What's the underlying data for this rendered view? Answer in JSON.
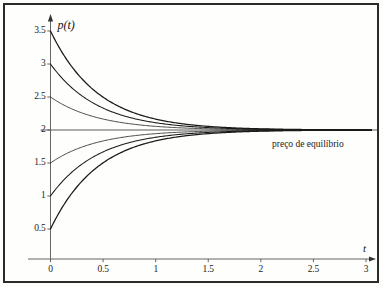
{
  "figure": {
    "background_color": "#fdfdfb",
    "frame_color": "#2a2a2a",
    "curve_color": "#1a1a1a",
    "axis_color": "#555555"
  },
  "axes": {
    "y_title": "p(t)",
    "x_title": "t",
    "x_ticks": [
      "0",
      "0.5",
      "1",
      "1.5",
      "2",
      "2.5",
      "3"
    ],
    "x_tick_values": [
      0,
      0.5,
      1,
      1.5,
      2,
      2.5,
      3
    ],
    "y_ticks": [
      "0.5",
      "1",
      "1.5",
      "2",
      "2.5",
      "3",
      "3.5"
    ],
    "y_tick_values": [
      0.5,
      1,
      1.5,
      2,
      2.5,
      3,
      3.5
    ]
  },
  "annotations": {
    "equilibrium": "preço de equilíbrio",
    "equilibrium_value": 2
  },
  "chart_data": {
    "type": "line",
    "title": "",
    "xlabel": "t",
    "ylabel": "p(t)",
    "xlim": [
      0,
      3.1
    ],
    "ylim": [
      0.3,
      3.72
    ],
    "grid": false,
    "legend": false,
    "equilibrium_line": {
      "y": 2,
      "label": "preço de equilíbrio"
    },
    "x": [
      0,
      0.1,
      0.2,
      0.3,
      0.4,
      0.5,
      0.6,
      0.7,
      0.8,
      0.9,
      1.0,
      1.2,
      1.4,
      1.6,
      1.8,
      2.0,
      2.2,
      2.4,
      2.6,
      2.8,
      3.0
    ],
    "series": [
      {
        "name": "p0 = 3.5",
        "initial_value": 3.5,
        "values": [
          3.5,
          3.142,
          2.874,
          2.674,
          2.524,
          2.412,
          2.328,
          2.264,
          2.217,
          2.181,
          2.155,
          2.116,
          2.087,
          2.065,
          2.049,
          2.037,
          2.027,
          2.02,
          2.015,
          2.011,
          2.008
        ]
      },
      {
        "name": "p0 = 3.0",
        "initial_value": 3.0,
        "values": [
          3.0,
          2.762,
          2.582,
          2.449,
          2.349,
          2.275,
          2.218,
          2.176,
          2.145,
          2.121,
          2.103,
          2.077,
          2.058,
          2.043,
          2.033,
          2.024,
          2.018,
          2.014,
          2.01,
          2.007,
          2.006
        ]
      },
      {
        "name": "p0 = 2.5",
        "initial_value": 2.5,
        "values": [
          2.5,
          2.381,
          2.291,
          2.225,
          2.175,
          2.137,
          2.109,
          2.088,
          2.072,
          2.06,
          2.051,
          2.038,
          2.029,
          2.022,
          2.016,
          2.012,
          2.009,
          2.007,
          2.005,
          2.004,
          2.003
        ]
      },
      {
        "name": "p0 = 1.5",
        "initial_value": 1.5,
        "values": [
          1.5,
          1.619,
          1.709,
          1.775,
          1.825,
          1.863,
          1.891,
          1.912,
          1.928,
          1.94,
          1.949,
          1.962,
          1.971,
          1.978,
          1.984,
          1.988,
          1.991,
          1.993,
          1.995,
          1.996,
          1.997
        ]
      },
      {
        "name": "p0 = 1.0",
        "initial_value": 1.0,
        "values": [
          1.0,
          1.238,
          1.418,
          1.551,
          1.651,
          1.725,
          1.782,
          1.824,
          1.855,
          1.879,
          1.897,
          1.923,
          1.942,
          1.957,
          1.967,
          1.976,
          1.982,
          1.986,
          1.99,
          1.993,
          1.994
        ]
      },
      {
        "name": "p0 = 0.5",
        "initial_value": 0.5,
        "values": [
          0.5,
          0.858,
          1.126,
          1.326,
          1.476,
          1.588,
          1.672,
          1.736,
          1.783,
          1.819,
          1.845,
          1.884,
          1.913,
          1.935,
          1.951,
          1.963,
          1.973,
          1.98,
          1.985,
          1.989,
          1.992
        ]
      }
    ]
  }
}
